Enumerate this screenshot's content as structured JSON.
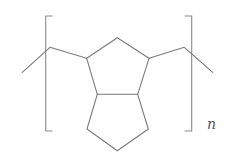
{
  "diagram": {
    "type": "chemical-structure",
    "repeat_subscript": "n",
    "colors": {
      "bond": "#7a7a7a",
      "bracket": "#8a8a8a",
      "text": "#555555",
      "background": "#ffffff"
    },
    "rings": [
      {
        "name": "upper-cyclopentane",
        "atoms": 5
      },
      {
        "name": "lower-cyclopentane",
        "atoms": 5
      }
    ],
    "brackets": [
      "left",
      "right"
    ]
  }
}
